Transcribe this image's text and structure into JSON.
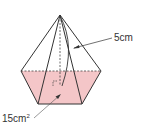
{
  "figure": {
    "type": "pentagonal pyramid",
    "base_fill": "#f4c6c8",
    "line_color": "#333333"
  },
  "labels": {
    "slant_height": "5cm",
    "base_area_value": "15cm",
    "base_area_exp": "2"
  }
}
